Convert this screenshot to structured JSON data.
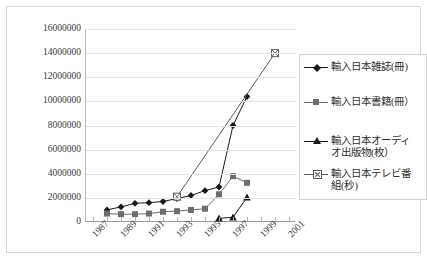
{
  "chart_data": {
    "type": "line",
    "title": "",
    "xlabel": "",
    "ylabel": "",
    "ylim": [
      0,
      16000000
    ],
    "ytick_values": [
      0,
      2000000,
      4000000,
      6000000,
      8000000,
      10000000,
      12000000,
      14000000,
      16000000
    ],
    "ytick_labels": [
      "0",
      "2000000",
      "4000000",
      "6000000",
      "8000000",
      "10000000",
      "12000000",
      "14000000",
      "16000000"
    ],
    "grid": true,
    "legend_position": "right",
    "categories": [
      "1987",
      "1988",
      "1989",
      "1990",
      "1991",
      "1992",
      "1993",
      "1994",
      "1995",
      "1996",
      "1997",
      "1998",
      "1999",
      "2000",
      "2001"
    ],
    "xtick_labels": [
      "1987",
      "1989",
      "1991",
      "1993",
      "1995",
      "1997",
      "1999",
      "2001"
    ],
    "series": [
      {
        "name": "輸入日本雑誌(冊)",
        "marker": "diamond",
        "color": "#1a1a1a",
        "values": [
          null,
          1000000,
          1250000,
          1550000,
          1600000,
          1700000,
          1950000,
          2200000,
          2600000,
          2900000,
          8000000,
          10400000,
          null,
          null,
          null
        ]
      },
      {
        "name": "輸入日本書籍(冊）",
        "marker": "square",
        "color": "#6e6e6e",
        "values": [
          null,
          700000,
          650000,
          650000,
          700000,
          850000,
          900000,
          1000000,
          1100000,
          2300000,
          3800000,
          3250000,
          null,
          null,
          null
        ]
      },
      {
        "name": "輸入日本オーディ\nオ出版物(枚）",
        "marker": "triangle",
        "color": "#1a1a1a",
        "values": [
          null,
          null,
          null,
          null,
          null,
          null,
          null,
          null,
          null,
          300000,
          400000,
          2050000,
          null,
          null,
          null
        ]
      },
      {
        "name": "輸入日本テレビ番\n組(秒)",
        "marker": "crossed-square",
        "color": "#5a5a5a",
        "values": [
          null,
          null,
          null,
          null,
          null,
          null,
          2100000,
          null,
          null,
          null,
          null,
          null,
          null,
          14000000,
          null
        ]
      }
    ]
  }
}
